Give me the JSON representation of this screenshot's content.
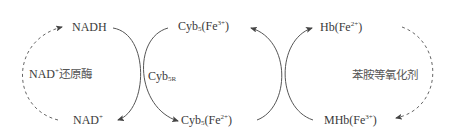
{
  "diagram": {
    "type": "coupled redox reaction cycle",
    "nodes": {
      "nadh": {
        "base": "NADH"
      },
      "nad_plus": {
        "base": "NAD",
        "sup": "+"
      },
      "cyb5_fe3": {
        "base": "Cyb",
        "sub": "5",
        "paren_open": "(Fe",
        "sup": "3+",
        "paren_close": ")"
      },
      "cyb5_fe2": {
        "base": "Cyb",
        "sub": "5",
        "paren_open": "(Fe",
        "sup": "2+",
        "paren_close": ")"
      },
      "hb_fe2": {
        "base": "Hb(Fe",
        "sup": "2+",
        "paren_close": ")"
      },
      "mhb_fe3": {
        "base": "MHb(Fe",
        "sup": "3+",
        "paren_close": ")"
      }
    },
    "labels": {
      "left_enzyme": {
        "base": "NAD",
        "sup": "+",
        "rest": "还原酶"
      },
      "center_enzyme": {
        "base": "Cyb",
        "sub": "5R"
      },
      "right_agent": "苯胺等氧化剂"
    },
    "edges": [
      {
        "from": "NAD+",
        "to": "NADH",
        "style": "dashed",
        "label": "NAD+还原酶"
      },
      {
        "from": "NADH",
        "to": "NAD+",
        "style": "solid",
        "label": "Cyb5R"
      },
      {
        "from": "Cyb5(Fe3+)",
        "to": "Cyb5(Fe2+)",
        "style": "solid",
        "label": "Cyb5R"
      },
      {
        "from": "Cyb5(Fe2+)",
        "to": "Cyb5(Fe3+)",
        "style": "solid"
      },
      {
        "from": "MHb(Fe3+)",
        "to": "Hb(Fe2+)",
        "style": "solid"
      },
      {
        "from": "Hb(Fe2+)",
        "to": "MHb(Fe3+)",
        "style": "dashed",
        "label": "苯胺等氧化剂"
      }
    ],
    "colors": {
      "line": "#555555",
      "text": "#3a3a3a"
    }
  }
}
